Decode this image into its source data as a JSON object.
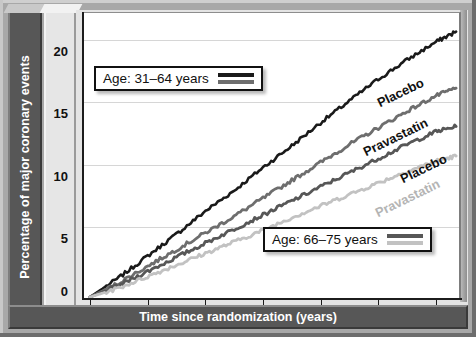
{
  "chart_data": {
    "type": "line",
    "title": "",
    "xlabel": "Time since randomization (years)",
    "ylabel": "Percentage of major coronary events",
    "xlim": [
      0,
      6.4
    ],
    "ylim": [
      0,
      22
    ],
    "xticks": [
      "0",
      "1",
      "2",
      "3",
      "4",
      "5",
      "6"
    ],
    "yticks": [
      "0",
      "5",
      "10",
      "15",
      "20"
    ],
    "grid": true,
    "legend_position": "inside-plot",
    "series": [
      {
        "name": "Placebo",
        "group": "Age: 31–64 years",
        "color": "#1a1a1a",
        "x": [
          0,
          0.5,
          1,
          1.5,
          2,
          2.5,
          3,
          3.5,
          4,
          4.5,
          5,
          5.5,
          6,
          6.35
        ],
        "values": [
          0,
          1.5,
          3.2,
          4.9,
          6.7,
          8.3,
          10.1,
          11.8,
          13.6,
          15.3,
          17.0,
          18.5,
          19.9,
          20.7
        ]
      },
      {
        "name": "Pravastatin",
        "group": "Age: 31–64 years",
        "color": "#6e6e6e",
        "x": [
          0,
          0.5,
          1,
          1.5,
          2,
          2.5,
          3,
          3.5,
          4,
          4.5,
          5,
          5.5,
          6,
          6.35
        ],
        "values": [
          0,
          1.1,
          2.4,
          3.7,
          5.0,
          6.3,
          7.7,
          9.1,
          10.5,
          11.9,
          13.2,
          14.5,
          15.7,
          16.3
        ]
      },
      {
        "name": "Placebo",
        "group": "Age: 66–75 years",
        "color": "#575757",
        "x": [
          0,
          0.5,
          1,
          1.5,
          2,
          2.5,
          3,
          3.5,
          4,
          4.5,
          5,
          5.5,
          6,
          6.35
        ],
        "values": [
          0,
          0.9,
          2.0,
          3.1,
          4.2,
          5.3,
          6.4,
          7.5,
          8.6,
          9.7,
          10.8,
          11.9,
          12.9,
          13.3
        ]
      },
      {
        "name": "Pravastatin",
        "group": "Age: 66–75 years",
        "color": "#c2c2c2",
        "x": [
          0,
          0.5,
          1,
          1.5,
          2,
          2.5,
          3,
          3.5,
          4,
          4.5,
          5,
          5.5,
          6,
          6.35
        ],
        "values": [
          0,
          0.7,
          1.6,
          2.5,
          3.4,
          4.3,
          5.2,
          6.2,
          7.1,
          8.0,
          8.9,
          9.8,
          10.6,
          11.0
        ]
      }
    ],
    "annotations": [
      {
        "text": "Placebo",
        "series": 0
      },
      {
        "text": "Pravastatin",
        "series": 1
      },
      {
        "text": "Placebo",
        "series": 2
      },
      {
        "text": "Pravastatin",
        "series": 3
      }
    ]
  },
  "legends": [
    {
      "label": "Age: 31–64 years",
      "keys": [
        "#1a1a1a",
        "#6e6e6e"
      ]
    },
    {
      "label": "Age: 66–75 years",
      "keys": [
        "#575757",
        "#c2c2c2"
      ]
    }
  ]
}
